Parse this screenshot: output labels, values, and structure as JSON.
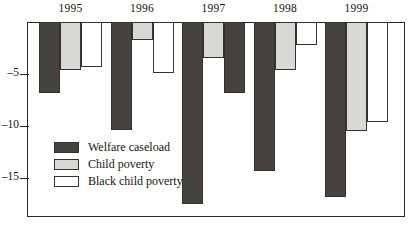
{
  "chart_data": {
    "type": "bar",
    "title": "",
    "subtitle": "",
    "xlabel": "",
    "ylabel": "",
    "categories": [
      "1995",
      "1996",
      "1997",
      "1998",
      "1999"
    ],
    "series": [
      {
        "name": "Welfare caseload",
        "color": "#46423d",
        "values": [
          -6.8,
          -10.4,
          -17.5,
          -14.3,
          -16.8
        ]
      },
      {
        "name": "Child poverty",
        "color": "#d8d8d4",
        "values": [
          -4.6,
          -1.7,
          -3.5,
          -4.6,
          -10.5
        ]
      },
      {
        "name": "Black child poverty",
        "color": "#ffffff",
        "values": [
          -4.3,
          -4.9,
          -6.8,
          -2.2,
          -9.6
        ]
      }
    ],
    "ylim": [
      -18.7,
      0
    ],
    "yticks": [
      -5,
      -10,
      -15
    ],
    "ytick_labels": [
      "–5",
      "–10",
      "–15"
    ],
    "grid": false,
    "legend_position": "inside-bottom-left",
    "axis_color": "#2b2721",
    "background": "#ffffff",
    "note": "1997 Black child poverty bar is rendered with dark fill in the source image"
  },
  "legend": {
    "items": [
      {
        "label": "Welfare caseload",
        "swatch": "welfare"
      },
      {
        "label": "Child poverty",
        "swatch": "child"
      },
      {
        "label": "Black child poverty",
        "swatch": "black-child"
      }
    ]
  }
}
